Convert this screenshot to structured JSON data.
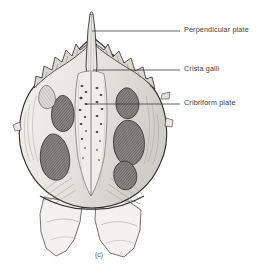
{
  "figure": {
    "caption": "(c)",
    "background_color": "#ffffff",
    "ink_color": "#3a3a3a"
  },
  "labels": [
    {
      "id": "perpendicular-plate",
      "text": "Perpendicular plate",
      "leader": {
        "x1": 92,
        "y1": 31,
        "x2": 180,
        "y2": 31
      }
    },
    {
      "id": "crista-galli",
      "text": "Crista galli",
      "leader": {
        "x1": 93,
        "y1": 70,
        "x2": 180,
        "y2": 70
      }
    },
    {
      "id": "cribriform-plate",
      "text": "Cribriform plate",
      "leader": {
        "x1": 85,
        "y1": 104,
        "x2": 180,
        "y2": 104
      }
    }
  ],
  "colors": {
    "bone_light": "#ebeae7",
    "bone_mid": "#cfcdc8",
    "bone_shadow": "#a9a7a2",
    "air_cell_dark": "#6e6c68",
    "outline": "#2e2e2e",
    "hatch": "#5a5856"
  }
}
